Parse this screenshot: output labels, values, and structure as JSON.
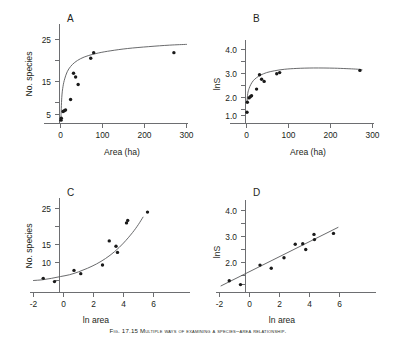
{
  "figure": {
    "caption_lead": "Fig. 17.15",
    "caption_text": "Fig. 17.15 Multiple ways of examining a species–area relationship.",
    "panels": [
      "A",
      "B",
      "C",
      "D"
    ]
  },
  "chart_data": [
    {
      "type": "scatter",
      "panel": "A",
      "title": "A",
      "xlabel": "Area (ha)",
      "ylabel": "No. species",
      "xlim": [
        -8,
        320
      ],
      "ylim": [
        0,
        28
      ],
      "xticks": [
        0,
        100,
        200,
        300
      ],
      "xticklabels": [
        "0",
        "100",
        "200",
        "300"
      ],
      "yticks": [
        5,
        10,
        15,
        20,
        25
      ],
      "yticklabels": [
        "5",
        "",
        "15",
        "",
        "25"
      ],
      "grid": false,
      "legend": "none",
      "x": [
        1.2,
        2.0,
        6.0,
        9.0,
        12.0,
        24.0,
        31.0,
        36.0,
        42.0,
        72.0,
        79.0,
        270.0
      ],
      "y": [
        3.5,
        4.0,
        5.8,
        6.0,
        6.2,
        9.0,
        16.0,
        15.0,
        13.0,
        20.0,
        21.5,
        21.5
      ],
      "fit": {
        "kind": "saturating",
        "comment": "S = a*ln(Area)+b style rising saturating curve",
        "points": [
          [
            1.0,
            4.0
          ],
          [
            3.0,
            9.5
          ],
          [
            6.0,
            12.5
          ],
          [
            10.0,
            14.5
          ],
          [
            16.0,
            16.4
          ],
          [
            24.0,
            17.8
          ],
          [
            34.0,
            18.9
          ],
          [
            48.0,
            19.9
          ],
          [
            66.0,
            20.7
          ],
          [
            90.0,
            21.4
          ],
          [
            120.0,
            22.0
          ],
          [
            160.0,
            22.6
          ],
          [
            210.0,
            23.1
          ],
          [
            260.0,
            23.5
          ],
          [
            300.0,
            23.7
          ]
        ]
      }
    },
    {
      "type": "scatter",
      "panel": "B",
      "title": "B",
      "xlabel": "Area (ha)",
      "ylabel": "lnS",
      "xlim": [
        -8,
        320
      ],
      "ylim": [
        0.4,
        4.6
      ],
      "xticks": [
        0,
        100,
        200,
        300
      ],
      "xticklabels": [
        "0",
        "100",
        "200",
        "300"
      ],
      "yticks": [
        1.0,
        1.5,
        2.0,
        2.5,
        3.0,
        3.5,
        4.0
      ],
      "yticklabels": [
        "1.0",
        "",
        "2.0",
        "",
        "3.0",
        "",
        "4.0"
      ],
      "grid": false,
      "legend": "none",
      "x": [
        1.2,
        2.0,
        6.0,
        9.0,
        12.0,
        24.0,
        31.0,
        36.0,
        42.0,
        72.0,
        79.0,
        270.0
      ],
      "y": [
        1.15,
        1.6,
        1.8,
        1.85,
        1.9,
        2.2,
        2.85,
        2.65,
        2.55,
        2.9,
        2.95,
        3.05
      ],
      "fit": {
        "kind": "saturating",
        "points": [
          [
            1.0,
            1.6
          ],
          [
            3.0,
            2.0
          ],
          [
            6.0,
            2.22
          ],
          [
            10.0,
            2.4
          ],
          [
            16.0,
            2.58
          ],
          [
            24.0,
            2.72
          ],
          [
            34.0,
            2.84
          ],
          [
            48.0,
            2.95
          ],
          [
            66.0,
            3.03
          ],
          [
            90.0,
            3.1
          ],
          [
            120.0,
            3.14
          ],
          [
            160.0,
            3.16
          ],
          [
            210.0,
            3.15
          ],
          [
            260.0,
            3.11
          ],
          [
            275.0,
            3.08
          ]
        ]
      }
    },
    {
      "type": "scatter",
      "panel": "C",
      "title": "C",
      "xlabel": "ln area",
      "ylabel": "No. species",
      "xlim": [
        -2.4,
        7.0
      ],
      "ylim": [
        0,
        28
      ],
      "xticks": [
        -2,
        0,
        2,
        4,
        6
      ],
      "xticklabels": [
        "-2",
        "0",
        "2",
        "4",
        "6"
      ],
      "yticks": [
        5,
        10,
        15,
        20,
        25
      ],
      "yticklabels": [
        "",
        "10",
        "15",
        "",
        "25"
      ],
      "grid": false,
      "legend": "none",
      "x": [
        -1.35,
        -0.6,
        0.7,
        1.15,
        2.6,
        3.05,
        3.5,
        3.6,
        4.2,
        4.28,
        5.6
      ],
      "y": [
        5.6,
        4.7,
        7.8,
        6.9,
        9.3,
        16.0,
        14.5,
        12.8,
        21.0,
        21.7,
        24.0
      ],
      "fit": {
        "kind": "exponential",
        "points": [
          [
            -2.0,
            5.0
          ],
          [
            -1.4,
            5.2
          ],
          [
            -0.8,
            5.6
          ],
          [
            -0.2,
            6.1
          ],
          [
            0.4,
            6.6
          ],
          [
            1.0,
            7.4
          ],
          [
            1.6,
            8.4
          ],
          [
            2.2,
            9.6
          ],
          [
            2.8,
            11.1
          ],
          [
            3.4,
            13.0
          ],
          [
            4.0,
            15.4
          ],
          [
            4.6,
            18.3
          ],
          [
            5.0,
            20.6
          ],
          [
            5.3,
            22.6
          ]
        ]
      }
    },
    {
      "type": "scatter",
      "panel": "D",
      "title": "D",
      "xlabel": "ln area",
      "ylabel": "lnS",
      "xlim": [
        -2.4,
        7.0
      ],
      "ylim": [
        0.4,
        4.6
      ],
      "xticks": [
        -2,
        0,
        2,
        4,
        6
      ],
      "xticklabels": [
        "-2",
        "0",
        "2",
        "4",
        "6"
      ],
      "yticks": [
        1.0,
        1.5,
        2.0,
        2.5,
        3.0,
        3.5,
        4.0
      ],
      "yticklabels": [
        "",
        "",
        "2.0",
        "",
        "3.0",
        "",
        "4.0"
      ],
      "grid": false,
      "legend": "none",
      "x": [
        -1.35,
        -0.6,
        0.7,
        1.45,
        2.3,
        3.05,
        3.55,
        3.75,
        4.3,
        4.33,
        5.6
      ],
      "y": [
        1.3,
        1.15,
        1.9,
        1.78,
        2.18,
        2.7,
        2.72,
        2.5,
        3.08,
        2.88,
        3.12
      ],
      "fit": {
        "kind": "linear",
        "x_endpoints": [
          -1.9,
          5.9
        ],
        "y_endpoints": [
          1.1,
          3.35
        ]
      }
    }
  ]
}
